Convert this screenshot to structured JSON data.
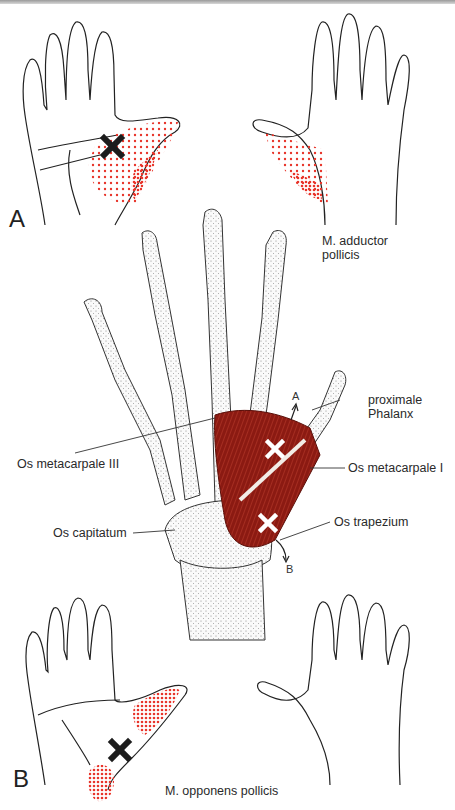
{
  "figure": {
    "panel_a": {
      "letter": "A",
      "muscle_label_line1": "M. adductor",
      "muscle_label_line2": "pollicis"
    },
    "panel_b": {
      "letter": "B",
      "muscle_label": "M. opponens pollicis"
    },
    "skeleton": {
      "labels": {
        "proximal_phalanx_line1": "proximale",
        "proximal_phalanx_line2": "Phalanx",
        "metacarpal_1": "Os metacarpale I",
        "metacarpal_3": "Os metacarpale III",
        "capitate": "Os capitatum",
        "trapezium": "Os trapezium"
      },
      "arrow_labels": {
        "up": "A",
        "down": "B"
      }
    },
    "markers": {
      "trigger_point_symbol": "X",
      "referred_pain_color": "#e8342a",
      "muscle_color": "#8b1a12",
      "trigger_black": "#1c1c1c",
      "trigger_white": "#ffffff"
    }
  }
}
